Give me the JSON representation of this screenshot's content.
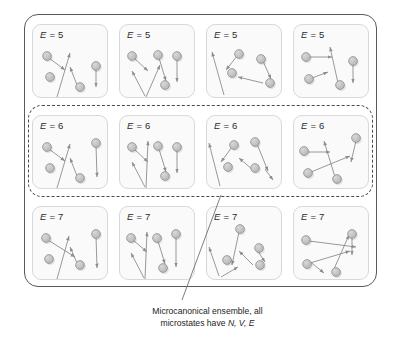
{
  "figure": {
    "title_caption_line1": "Microcanonical ensemble, all",
    "title_caption_line2_prefix": "microstates have ",
    "title_caption_line2_vars": "N, V, E",
    "colors": {
      "outer_border": "#59595b",
      "dashed_border": "#4a4a4c",
      "cell_border": "#d8d8d8",
      "cell_fill": "#fafafa",
      "particle_fill": "#b5b5b5",
      "particle_stroke": "#8a8a8a",
      "arrow": "#8d8d91",
      "text": "#2b2b2b"
    }
  },
  "grid": {
    "rows": 3,
    "cols": 4,
    "highlighted_row_index": 1,
    "cells": [
      {
        "label_prefix": "E",
        "label_eq": " = ",
        "label_value": "5",
        "energy": 5,
        "row": 0,
        "col": 0
      },
      {
        "label_prefix": "E",
        "label_eq": " = ",
        "label_value": "5",
        "energy": 5,
        "row": 0,
        "col": 1
      },
      {
        "label_prefix": "E",
        "label_eq": " = ",
        "label_value": "5",
        "energy": 5,
        "row": 0,
        "col": 2
      },
      {
        "label_prefix": "E",
        "label_eq": " = ",
        "label_value": "5",
        "energy": 5,
        "row": 0,
        "col": 3
      },
      {
        "label_prefix": "E",
        "label_eq": " = ",
        "label_value": "6",
        "energy": 6,
        "row": 1,
        "col": 0
      },
      {
        "label_prefix": "E",
        "label_eq": " = ",
        "label_value": "6",
        "energy": 6,
        "row": 1,
        "col": 1
      },
      {
        "label_prefix": "E",
        "label_eq": " = ",
        "label_value": "6",
        "energy": 6,
        "row": 1,
        "col": 2
      },
      {
        "label_prefix": "E",
        "label_eq": " = ",
        "label_value": "6",
        "energy": 6,
        "row": 1,
        "col": 3
      },
      {
        "label_prefix": "E",
        "label_eq": " = ",
        "label_value": "7",
        "energy": 7,
        "row": 2,
        "col": 0
      },
      {
        "label_prefix": "E",
        "label_eq": " = ",
        "label_value": "7",
        "energy": 7,
        "row": 2,
        "col": 1
      },
      {
        "label_prefix": "E",
        "label_eq": " = ",
        "label_value": "7",
        "energy": 7,
        "row": 2,
        "col": 2
      },
      {
        "label_prefix": "E",
        "label_eq": " = ",
        "label_value": "7",
        "energy": 7,
        "row": 2,
        "col": 3
      }
    ]
  },
  "microstates": [
    {
      "id": "r0c0",
      "particles": [
        [
          14,
          31
        ],
        [
          17,
          52
        ],
        [
          47,
          62
        ],
        [
          63,
          41
        ]
      ],
      "arrows": [
        [
          16,
          33,
          32,
          45
        ],
        [
          24,
          72,
          37,
          28
        ],
        [
          44,
          60,
          37,
          42
        ],
        [
          63,
          43,
          63,
          62
        ]
      ]
    },
    {
      "id": "r0c1",
      "particles": [
        [
          12,
          31
        ],
        [
          38,
          30
        ],
        [
          57,
          31
        ],
        [
          45,
          60
        ]
      ],
      "arrows": [
        [
          14,
          33,
          28,
          46
        ],
        [
          25,
          71,
          12,
          46
        ],
        [
          26,
          72,
          40,
          40
        ],
        [
          39,
          33,
          46,
          56
        ],
        [
          57,
          34,
          57,
          57
        ]
      ]
    },
    {
      "id": "r0c2",
      "particles": [
        [
          32,
          29
        ],
        [
          54,
          34
        ],
        [
          25,
          48
        ],
        [
          63,
          58
        ]
      ],
      "arrows": [
        [
          30,
          31,
          19,
          45
        ],
        [
          17,
          70,
          5,
          27
        ],
        [
          56,
          36,
          64,
          54
        ],
        [
          56,
          58,
          31,
          52
        ]
      ]
    },
    {
      "id": "r0c3",
      "particles": [
        [
          12,
          32
        ],
        [
          59,
          36
        ],
        [
          15,
          54
        ],
        [
          46,
          60
        ]
      ],
      "arrows": [
        [
          16,
          32,
          38,
          32
        ],
        [
          44,
          58,
          36,
          22
        ],
        [
          59,
          38,
          59,
          58
        ],
        [
          18,
          53,
          34,
          47
        ]
      ]
    },
    {
      "id": "r1c0",
      "particles": [
        [
          14,
          31
        ],
        [
          17,
          52
        ],
        [
          47,
          62
        ],
        [
          63,
          27
        ]
      ],
      "arrows": [
        [
          16,
          33,
          32,
          45
        ],
        [
          24,
          72,
          37,
          28
        ],
        [
          44,
          60,
          37,
          42
        ],
        [
          63,
          29,
          64,
          61
        ]
      ]
    },
    {
      "id": "r1c1",
      "particles": [
        [
          12,
          31
        ],
        [
          38,
          30
        ],
        [
          57,
          31
        ],
        [
          45,
          60
        ]
      ],
      "arrows": [
        [
          14,
          33,
          28,
          46
        ],
        [
          25,
          71,
          12,
          46
        ],
        [
          26,
          72,
          28,
          25
        ],
        [
          39,
          33,
          46,
          56
        ],
        [
          57,
          34,
          57,
          57
        ]
      ]
    },
    {
      "id": "r1c2",
      "particles": [
        [
          27,
          29
        ],
        [
          48,
          26
        ],
        [
          21,
          51
        ],
        [
          48,
          52
        ]
      ],
      "arrows": [
        [
          25,
          31,
          14,
          46
        ],
        [
          13,
          70,
          2,
          27
        ],
        [
          50,
          28,
          61,
          55
        ],
        [
          46,
          54,
          32,
          42
        ],
        [
          58,
          53,
          66,
          64
        ]
      ]
    },
    {
      "id": "r1c3",
      "particles": [
        [
          10,
          35
        ],
        [
          62,
          22
        ],
        [
          14,
          57
        ],
        [
          43,
          63
        ]
      ],
      "arrows": [
        [
          14,
          36,
          36,
          36
        ],
        [
          41,
          61,
          30,
          25
        ],
        [
          62,
          25,
          57,
          46
        ],
        [
          17,
          56,
          56,
          40
        ]
      ]
    },
    {
      "id": "r2c0",
      "particles": [
        [
          13,
          31
        ],
        [
          16,
          52
        ],
        [
          47,
          58
        ],
        [
          63,
          27
        ]
      ],
      "arrows": [
        [
          15,
          33,
          42,
          50
        ],
        [
          24,
          72,
          36,
          29
        ],
        [
          44,
          56,
          37,
          40
        ],
        [
          63,
          29,
          64,
          61
        ]
      ]
    },
    {
      "id": "r2c1",
      "particles": [
        [
          11,
          31
        ],
        [
          37,
          31
        ],
        [
          56,
          27
        ],
        [
          43,
          61
        ]
      ],
      "arrows": [
        [
          13,
          33,
          27,
          45
        ],
        [
          24,
          71,
          11,
          46
        ],
        [
          25,
          72,
          27,
          25
        ],
        [
          38,
          34,
          45,
          57
        ],
        [
          56,
          30,
          56,
          60
        ]
      ]
    },
    {
      "id": "r2c2",
      "particles": [
        [
          33,
          22
        ],
        [
          20,
          53
        ],
        [
          52,
          41
        ],
        [
          53,
          58
        ]
      ],
      "arrows": [
        [
          32,
          25,
          25,
          58
        ],
        [
          12,
          69,
          2,
          40
        ],
        [
          14,
          70,
          31,
          60
        ],
        [
          50,
          43,
          58,
          55
        ],
        [
          46,
          58,
          32,
          44
        ]
      ]
    },
    {
      "id": "r2c3",
      "particles": [
        [
          12,
          33
        ],
        [
          58,
          27
        ],
        [
          13,
          57
        ],
        [
          42,
          65
        ]
      ],
      "arrows": [
        [
          15,
          34,
          62,
          40
        ],
        [
          40,
          62,
          55,
          28
        ],
        [
          58,
          30,
          58,
          48
        ],
        [
          16,
          56,
          56,
          44
        ],
        [
          14,
          53,
          30,
          66
        ]
      ]
    }
  ],
  "leader_line": {
    "from_x": 221,
    "from_y": 195,
    "to_x": 182,
    "to_y": 300
  }
}
